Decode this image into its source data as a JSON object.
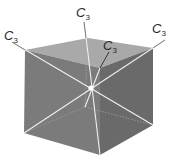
{
  "figure": {
    "axis_symbol": "C",
    "axis_order": "3",
    "labels": [
      {
        "id": "axis-1",
        "text": "C",
        "sub": "3"
      },
      {
        "id": "axis-2",
        "text": "C",
        "sub": "3"
      },
      {
        "id": "axis-3",
        "text": "C",
        "sub": "3"
      },
      {
        "id": "axis-4",
        "text": "C",
        "sub": "3"
      }
    ],
    "colors": {
      "top_face": "#a9a9a9",
      "left_face": "#7b7b7b",
      "right_face": "#6c6c6c",
      "axis_line": "#f2f2f2",
      "center_point": "#ffffff",
      "label": "#2a2a2a"
    }
  }
}
